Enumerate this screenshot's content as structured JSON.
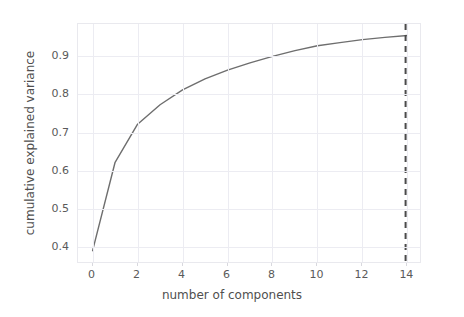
{
  "figure": {
    "background": "#ffffff",
    "plot_background": "#ffffff",
    "frame_color": "#e9e9ee",
    "grid_color": "#ececf2"
  },
  "axis": {
    "xlabel": "number of components",
    "ylabel": "cumulative explained variance",
    "xticks": [
      "0",
      "2",
      "4",
      "6",
      "8",
      "10",
      "12",
      "14"
    ],
    "yticks": [
      "0.9",
      "0.8",
      "0.7",
      "0.6",
      "0.5",
      "0.4"
    ]
  },
  "chart_data": {
    "type": "line",
    "title": "",
    "xlabel": "number of components",
    "ylabel": "cumulative explained variance",
    "xlim": [
      -0.65,
      14.65
    ],
    "ylim": [
      0.355,
      0.985
    ],
    "xticks": [
      0,
      2,
      4,
      6,
      8,
      10,
      12,
      14
    ],
    "yticks": [
      0.4,
      0.5,
      0.6,
      0.7,
      0.8,
      0.9
    ],
    "grid": true,
    "legend": null,
    "series": [
      {
        "name": "cumulative explained variance",
        "color": "#6e6e6e",
        "linewidth": 1.4,
        "linestyle": "solid",
        "x": [
          0,
          1,
          2,
          3,
          4,
          5,
          6,
          7,
          8,
          9,
          10,
          11,
          12,
          13,
          14
        ],
        "values": [
          0.39,
          0.622,
          0.722,
          0.773,
          0.812,
          0.841,
          0.864,
          0.883,
          0.9,
          0.915,
          0.928,
          0.936,
          0.944,
          0.95,
          0.955
        ]
      }
    ],
    "annotations": [
      {
        "kind": "vertical-line",
        "name": "selected-components-marker",
        "x": 13.92,
        "color": "#4a4a4a",
        "linestyle": "dashed",
        "linewidth": 2.0,
        "label": "14"
      }
    ]
  }
}
